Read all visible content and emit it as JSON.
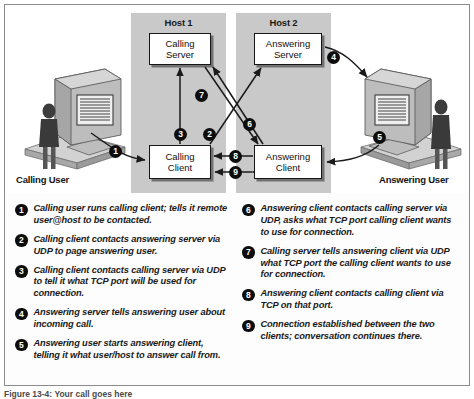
{
  "figure": {
    "caption": "Figure 13-4: Your call goes here"
  },
  "diagram": {
    "hosts": [
      {
        "label": "Host 1"
      },
      {
        "label": "Host 2"
      }
    ],
    "nodes": {
      "calling_server": {
        "line1": "Calling",
        "line2": "Server"
      },
      "answering_server": {
        "line1": "Answering",
        "line2": "Server"
      },
      "calling_client": {
        "line1": "Calling",
        "line2": "Client"
      },
      "answering_client": {
        "line1": "Answering",
        "line2": "Client"
      }
    },
    "users": {
      "calling": "Calling User",
      "answering": "Answering User"
    },
    "badges": {
      "b1": "1",
      "b2": "2",
      "b3": "3",
      "b4": "4",
      "b5": "5",
      "b6": "6",
      "b7": "7",
      "b8": "8",
      "b9": "9"
    },
    "colors": {
      "host_band": "#c9c9c9",
      "box_fill": "#ffffff",
      "box_stroke": "#161616",
      "badge_fill": "#0d0d0d",
      "monitor_body": "#b9b9b9",
      "person": "#3a3a3a"
    }
  },
  "legend": {
    "left_column": [
      {
        "num": "1",
        "text": "Calling user runs calling client; tells it remote user@host to be contacted."
      },
      {
        "num": "2",
        "text": "Calling client contacts answering server via UDP to page answering user."
      },
      {
        "num": "3",
        "text": "Calling client contacts calling server via UDP to tell it what TCP port will be used for connection."
      },
      {
        "num": "4",
        "text": "Answering server tells answering user about incoming call."
      },
      {
        "num": "5",
        "text": "Answering user starts answering client, telling it what user/host to answer call from."
      }
    ],
    "right_column": [
      {
        "num": "6",
        "text": "Answering client contacts calling server via UDP, asks what TCP port calling client wants to use for connection."
      },
      {
        "num": "7",
        "text": "Calling server tells answering client via UDP what TCP port the calling client wants to use for connection."
      },
      {
        "num": "8",
        "text": "Answering client contacts calling client via TCP on that port."
      },
      {
        "num": "9",
        "text": "Connection established between the two clients; conversation continues there."
      }
    ]
  }
}
